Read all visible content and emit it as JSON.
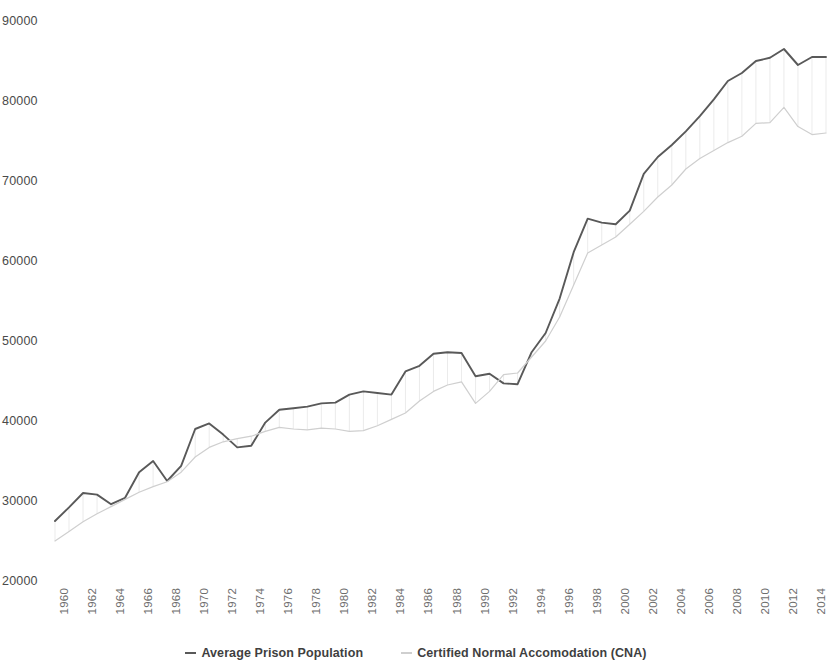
{
  "chart_data": {
    "type": "line",
    "title": "",
    "subtitle": "",
    "xlabel": "",
    "ylabel": "",
    "xlim": [
      1960,
      2015
    ],
    "ylim": [
      20000,
      90000
    ],
    "y_ticks": [
      20000,
      30000,
      40000,
      50000,
      60000,
      70000,
      80000,
      90000
    ],
    "y_tick_labels": [
      "20000",
      "30000",
      "40000",
      "50000",
      "60000",
      "70000",
      "80000",
      "90000"
    ],
    "x_ticks": [
      1960,
      1962,
      1964,
      1966,
      1968,
      1970,
      1972,
      1974,
      1976,
      1978,
      1980,
      1982,
      1984,
      1986,
      1988,
      1990,
      1992,
      1994,
      1996,
      1998,
      2000,
      2002,
      2004,
      2006,
      2008,
      2010,
      2012,
      2014
    ],
    "x_tick_labels": [
      "1960",
      "1962",
      "1964",
      "1966",
      "1968",
      "1970",
      "1972",
      "1974",
      "1976",
      "1978",
      "1980",
      "1982",
      "1984",
      "1986",
      "1988",
      "1990",
      "1992",
      "1994",
      "1996",
      "1998",
      "2000",
      "2002",
      "2004",
      "2006",
      "2008",
      "2010",
      "2012",
      "2014"
    ],
    "grid": false,
    "legend_position": "bottom",
    "x": [
      1960,
      1961,
      1962,
      1963,
      1964,
      1965,
      1966,
      1967,
      1968,
      1969,
      1970,
      1971,
      1972,
      1973,
      1974,
      1975,
      1976,
      1977,
      1978,
      1979,
      1980,
      1981,
      1982,
      1983,
      1984,
      1985,
      1986,
      1987,
      1988,
      1989,
      1990,
      1991,
      1992,
      1993,
      1994,
      1995,
      1996,
      1997,
      1998,
      1999,
      2000,
      2001,
      2002,
      2003,
      2004,
      2005,
      2006,
      2007,
      2008,
      2009,
      2010,
      2011,
      2012,
      2013,
      2014,
      2015
    ],
    "series": [
      {
        "name": "Average Prison Population",
        "color": "#595959",
        "values": [
          27500,
          29200,
          31000,
          30800,
          29600,
          30400,
          33600,
          35000,
          32500,
          34400,
          39000,
          39700,
          38300,
          36700,
          36900,
          39800,
          41400,
          41600,
          41800,
          42200,
          42300,
          43300,
          43700,
          43500,
          43300,
          46200,
          46900,
          48400,
          48600,
          48500,
          45600,
          45900,
          44700,
          44600,
          48600,
          51000,
          55300,
          61100,
          65300,
          64800,
          64600,
          66300,
          70900,
          73000,
          74500,
          76200,
          78100,
          80200,
          82500,
          83500,
          85000,
          85400,
          86500,
          84500,
          85500,
          85500
        ]
      },
      {
        "name": "Certified Normal Accomodation (CNA)",
        "color": "#cfcfcf",
        "values": [
          25000,
          26200,
          27400,
          28400,
          29300,
          30200,
          31100,
          31800,
          32400,
          33600,
          35500,
          36700,
          37400,
          37800,
          38100,
          38700,
          39200,
          39000,
          38900,
          39100,
          39000,
          38700,
          38800,
          39400,
          40200,
          41000,
          42500,
          43700,
          44500,
          44900,
          42200,
          43700,
          45800,
          46000,
          48000,
          50000,
          53000,
          57000,
          61000,
          62000,
          63000,
          64600,
          66200,
          68000,
          69500,
          71500,
          72800,
          73800,
          74800,
          75600,
          77200,
          77300,
          79200,
          76800,
          75800,
          76000
        ]
      }
    ]
  },
  "legend": {
    "items": [
      {
        "label": "Average Prison Population"
      },
      {
        "label": "Certified Normal Accomodation (CNA)"
      }
    ]
  }
}
